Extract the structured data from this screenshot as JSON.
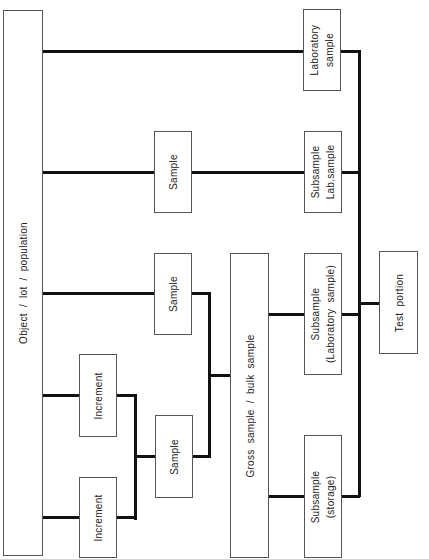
{
  "diagram": {
    "type": "sampling-hierarchy-flowchart",
    "orientation": "rotated-90-ccw",
    "colors": {
      "line": "#111111",
      "box_border": "#555555",
      "background": "#ffffff",
      "text": "#222222"
    },
    "nodes": {
      "object": {
        "label": "Object  /  lot  /  population"
      },
      "laboratory_sample": {
        "line1": "Laboratory",
        "line2": "sample"
      },
      "sample_top": {
        "label": "Sample"
      },
      "subsample_lab": {
        "line1": "Subsample",
        "line2": "Lab.sample"
      },
      "sample_mid": {
        "label": "Sample"
      },
      "gross_sample": {
        "label": "Gross  sample  /  bulk  sample"
      },
      "subsample_laboratory": {
        "line1": "Subsample",
        "line2": "(Laboratory  sample)"
      },
      "test_portion": {
        "label": "Test  portion"
      },
      "increment_1": {
        "label": "Increment"
      },
      "increment_2": {
        "label": "Increment"
      },
      "sample_bottom": {
        "label": "Sample"
      },
      "subsample_storage": {
        "line1": "Subsample",
        "line2": "(storage)"
      }
    },
    "edges": [
      [
        "object",
        "laboratory_sample"
      ],
      [
        "object",
        "sample_top"
      ],
      [
        "sample_top",
        "subsample_lab"
      ],
      [
        "object",
        "sample_mid"
      ],
      [
        "object",
        "increment_1"
      ],
      [
        "object",
        "increment_2"
      ],
      [
        "increment_1",
        "sample_bottom"
      ],
      [
        "increment_2",
        "sample_bottom"
      ],
      [
        "sample_bottom",
        "gross_sample"
      ],
      [
        "sample_mid",
        "gross_sample"
      ],
      [
        "gross_sample",
        "subsample_laboratory"
      ],
      [
        "gross_sample",
        "subsample_storage"
      ],
      [
        "laboratory_sample",
        "test_portion"
      ],
      [
        "subsample_lab",
        "test_portion"
      ],
      [
        "subsample_laboratory",
        "test_portion"
      ],
      [
        "subsample_storage",
        "test_portion"
      ]
    ]
  }
}
